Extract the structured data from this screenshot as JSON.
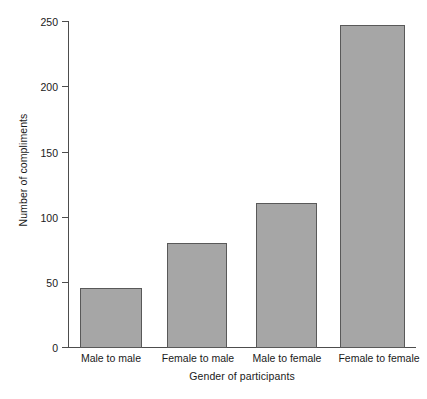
{
  "chart_data": {
    "type": "bar",
    "title": "",
    "subtitle": "",
    "categories": [
      "Male to male",
      "Female to male",
      "Male to female",
      "Female to female"
    ],
    "values": [
      46,
      80,
      111,
      247
    ],
    "xlabel": "Gender of participants",
    "ylabel": "Number of compliments",
    "ylim": [
      0,
      250
    ],
    "yticks": [
      0,
      50,
      100,
      150,
      200,
      250
    ],
    "ytick_labels": [
      "0",
      "50",
      "100",
      "150",
      "200",
      "250"
    ],
    "grid": false,
    "legend": null,
    "legend_position": "none",
    "annotations": [],
    "bar_color": "#a6a6a6",
    "bar_edge_color": "#595959",
    "axis_color": "#4d4d4d",
    "background_color": "#ffffff",
    "text_color": "#1a1a1a"
  }
}
